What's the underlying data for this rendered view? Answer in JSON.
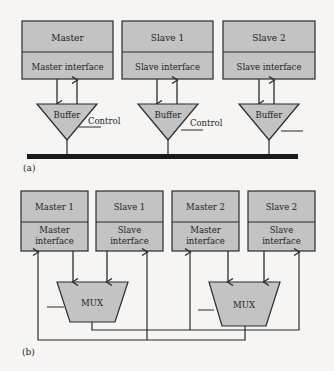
{
  "colors": {
    "fill": "#c3c3c3",
    "stroke": "#2b2b2b",
    "background": "#f6f5f3"
  },
  "part_a": {
    "label": "(a)",
    "blocks": [
      {
        "name": "Master",
        "interface": "Master interface"
      },
      {
        "name": "Slave 1",
        "interface": "Slave interface"
      },
      {
        "name": "Slave 2",
        "interface": "Slave interface"
      }
    ],
    "buffers": [
      {
        "label": "Buffer",
        "control": "Control"
      },
      {
        "label": "Buffer",
        "control": "Control"
      },
      {
        "label": "Buffer",
        "control": ""
      }
    ]
  },
  "part_b": {
    "label": "(b)",
    "blocks": [
      {
        "name": "Master 1",
        "interface_l1": "Master",
        "interface_l2": "interface"
      },
      {
        "name": "Slave 1",
        "interface_l1": "Slave",
        "interface_l2": "interface"
      },
      {
        "name": "Master 2",
        "interface_l1": "Master",
        "interface_l2": "interface"
      },
      {
        "name": "Slave 2",
        "interface_l1": "Slave",
        "interface_l2": "interface"
      }
    ],
    "muxes": [
      {
        "label": "MUX"
      },
      {
        "label": "MUX"
      }
    ]
  }
}
